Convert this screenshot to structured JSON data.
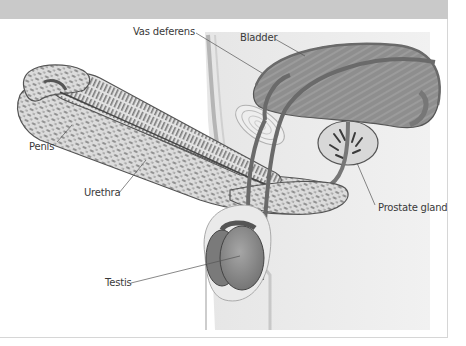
{
  "figure": {
    "header_color": "#c9c9c9",
    "labels": {
      "vas_deferens": "Vas deferens",
      "bladder": "Bladder",
      "penis": "Penis",
      "urethra": "Urethra",
      "prostate_gland": "Prostate gland",
      "testis": "Testis"
    }
  }
}
